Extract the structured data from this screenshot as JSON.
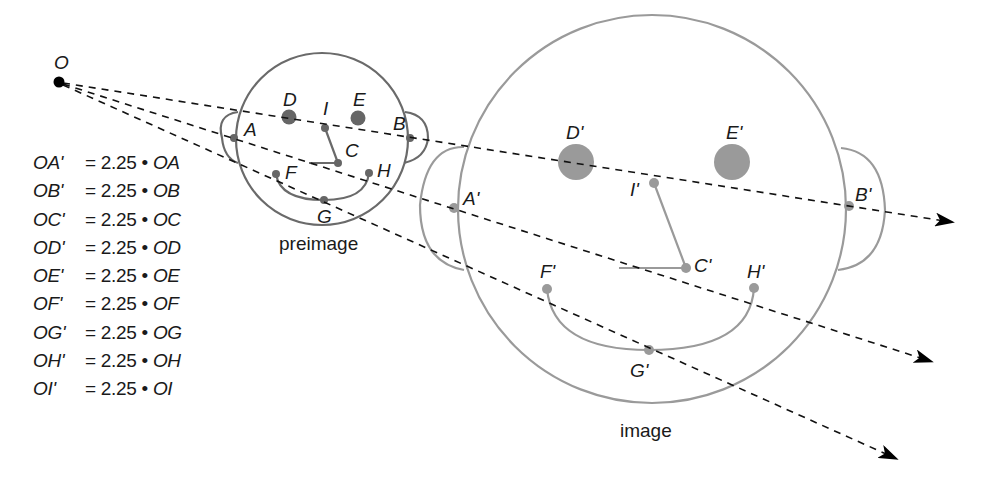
{
  "center": {
    "label": "O",
    "x": 59,
    "y": 82
  },
  "scale_factor": "2.25",
  "preimage": {
    "caption": "preimage",
    "color": "#6a6a6a",
    "head": {
      "cx": 322,
      "cy": 139,
      "r": 86
    },
    "points": {
      "A": {
        "label": "A",
        "x": 234,
        "y": 138
      },
      "B": {
        "label": "B",
        "x": 410,
        "y": 138
      },
      "C": {
        "label": "C",
        "x": 338,
        "y": 163
      },
      "D": {
        "label": "D",
        "x": 289,
        "y": 117
      },
      "E": {
        "label": "E",
        "x": 358,
        "y": 118
      },
      "F": {
        "label": "F",
        "x": 276,
        "y": 174
      },
      "G": {
        "label": "G",
        "x": 324,
        "y": 200
      },
      "H": {
        "label": "H",
        "x": 369,
        "y": 173
      },
      "I": {
        "label": "I",
        "x": 325,
        "y": 128
      }
    }
  },
  "image": {
    "caption": "image",
    "color": "#9a9a9a",
    "head": {
      "cx": 652,
      "cy": 209,
      "r": 194
    },
    "points": {
      "A": {
        "label": "A'",
        "x": 454,
        "y": 208
      },
      "B": {
        "label": "B'",
        "x": 849,
        "y": 206
      },
      "C": {
        "label": "C'",
        "x": 686,
        "y": 268
      },
      "D": {
        "label": "D'",
        "x": 576,
        "y": 162
      },
      "E": {
        "label": "E'",
        "x": 732,
        "y": 162
      },
      "F": {
        "label": "F'",
        "x": 547,
        "y": 289
      },
      "G": {
        "label": "G'",
        "x": 649,
        "y": 350
      },
      "H": {
        "label": "H'",
        "x": 754,
        "y": 288
      },
      "I": {
        "label": "I'",
        "x": 654,
        "y": 183
      }
    }
  },
  "rays": [
    {
      "through": "B",
      "end": {
        "x": 953,
        "y": 222
      }
    },
    {
      "through": "A",
      "end": {
        "x": 932,
        "y": 361
      }
    },
    {
      "through": "G",
      "end": {
        "x": 897,
        "y": 458
      }
    }
  ],
  "equations": [
    {
      "lhs": "OA'",
      "eq": "= 2.25 •",
      "rhs": "OA"
    },
    {
      "lhs": "OB'",
      "eq": "= 2.25 •",
      "rhs": "OB"
    },
    {
      "lhs": "OC'",
      "eq": "= 2.25 •",
      "rhs": "OC"
    },
    {
      "lhs": "OD'",
      "eq": "= 2.25 •",
      "rhs": "OD"
    },
    {
      "lhs": "OE'",
      "eq": "= 2.25 •",
      "rhs": "OE"
    },
    {
      "lhs": "OF'",
      "eq": "= 2.25 •",
      "rhs": "OF"
    },
    {
      "lhs": "OG'",
      "eq": "= 2.25 •",
      "rhs": "OG"
    },
    {
      "lhs": "OH'",
      "eq": "= 2.25 •",
      "rhs": "OH"
    },
    {
      "lhs": "OI'",
      "eq": "= 2.25 •",
      "rhs": "OI"
    }
  ]
}
